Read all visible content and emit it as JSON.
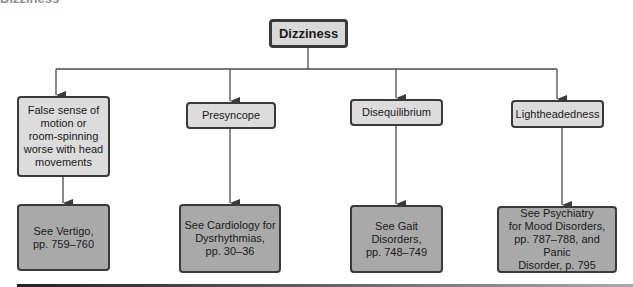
{
  "heading": "Dizziness",
  "root": {
    "label": "Dizziness"
  },
  "categories": [
    {
      "label": "False sense of\nmotion or\nroom-spinning\nworse with head\nmovements",
      "referral": "See Vertigo,\npp. 759–760"
    },
    {
      "label": "Presyncope",
      "referral": "See Cardiology for\nDysrhythmias,\npp. 30–36"
    },
    {
      "label": "Disequilibrium",
      "referral": "See Gait\nDisorders,\npp. 748–749"
    },
    {
      "label": "Lightheadedness",
      "referral": "See Psychiatry\nfor Mood Disorders,\npp. 787–788, and Panic\nDisorder, p. 795"
    }
  ],
  "colors": {
    "root_fill": "#d9d9d9",
    "level1_fill": "#dcdcdc",
    "level2_fill": "#a9a9a9",
    "stroke": "#3a3a3a"
  }
}
